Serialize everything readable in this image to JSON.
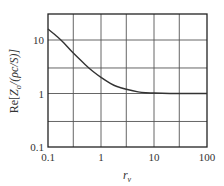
{
  "chart_data": {
    "type": "line",
    "title": "",
    "xlabel": "r_v",
    "xlabel_main": "r",
    "xlabel_sub": "v",
    "ylabel": "Re[Z_o/(ρc/S)]",
    "ylabel_parts": {
      "prefix": "Re[",
      "Z": "Z",
      "sub": "o",
      "suffix": "/(ρc/S)]"
    },
    "x_scale": "log",
    "y_scale": "log",
    "xlim": [
      0.1,
      100
    ],
    "ylim": [
      0.1,
      30
    ],
    "x_ticks": [
      {
        "value": 0.1,
        "label": "0.1"
      },
      {
        "value": 1,
        "label": "1"
      },
      {
        "value": 10,
        "label": "10"
      },
      {
        "value": 100,
        "label": "100"
      }
    ],
    "y_ticks": [
      {
        "value": 0.1,
        "label": "0.1"
      },
      {
        "value": 1,
        "label": "1"
      },
      {
        "value": 10,
        "label": "10"
      }
    ],
    "x_grid": [
      0.3,
      1,
      3,
      10,
      30
    ],
    "y_grid": [
      0.3,
      1,
      3,
      10
    ],
    "grid": true,
    "series": [
      {
        "name": "Re[Z_o/(ρc/S)]",
        "x": [
          0.1,
          0.15,
          0.2,
          0.3,
          0.5,
          0.7,
          1,
          1.5,
          2,
          3,
          5,
          7,
          10,
          20,
          30,
          50,
          100
        ],
        "y": [
          16,
          11.5,
          8.8,
          5.7,
          3.5,
          2.6,
          2.0,
          1.55,
          1.35,
          1.2,
          1.07,
          1.03,
          1.02,
          1.0,
          1.0,
          1.0,
          1.0
        ]
      }
    ],
    "colors": {
      "line": "#333333",
      "grid": "#555555",
      "frame": "#222222"
    }
  }
}
